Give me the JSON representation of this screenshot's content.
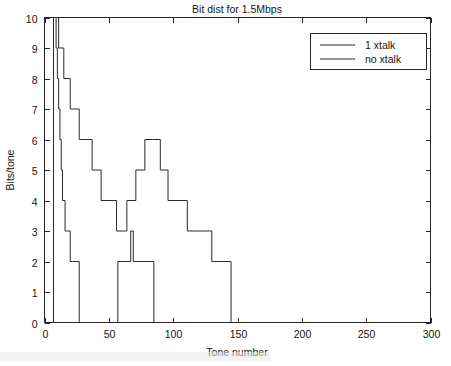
{
  "chart_data": {
    "type": "line",
    "title": "Bit dist for 1.5Mbps",
    "xlabel": "Tone number",
    "ylabel": "Bits/tone",
    "xlim": [
      0,
      300
    ],
    "ylim": [
      0,
      10
    ],
    "xticks": [
      0,
      50,
      100,
      150,
      200,
      250,
      300
    ],
    "yticks": [
      0,
      1,
      2,
      3,
      4,
      5,
      6,
      7,
      8,
      9,
      10
    ],
    "grid": false,
    "legend_position": "upper right",
    "series": [
      {
        "name": "1 xtalk",
        "comment": "broad staircase: rises at tone 7, plateaus, dips near tone 65, second peak of 6 near tone 90, decays to 0 at tone 145",
        "x": [
          6,
          7,
          7,
          11,
          11,
          15,
          15,
          20,
          20,
          27,
          27,
          37,
          37,
          44,
          44,
          56,
          56,
          62,
          62,
          64,
          64,
          71,
          71,
          78,
          78,
          84,
          84,
          90,
          90,
          96,
          96,
          103,
          103,
          111,
          111,
          122,
          122,
          130,
          130,
          145,
          145
        ],
        "y": [
          0,
          0,
          10,
          10,
          9,
          9,
          8,
          8,
          7,
          7,
          6,
          6,
          5,
          5,
          4,
          4,
          3,
          3,
          3,
          3,
          4,
          4,
          5,
          5,
          6,
          6,
          6,
          6,
          5,
          5,
          4,
          4,
          4,
          4,
          3,
          3,
          3,
          3,
          2,
          2,
          0
        ]
      },
      {
        "name": "no xtalk",
        "comment": "narrow steep staircase near origin plus a level-2 plateau between tones 57 and 85",
        "x": [
          6,
          7,
          7,
          9,
          9,
          10,
          10,
          11,
          11,
          12,
          12,
          13,
          13,
          14,
          14,
          16,
          16,
          18,
          18,
          20,
          20,
          22,
          22,
          27,
          27,
          57,
          57,
          67,
          67,
          69,
          69,
          85,
          85
        ],
        "y": [
          0,
          0,
          10,
          10,
          9,
          9,
          8,
          8,
          7,
          7,
          6,
          6,
          5,
          5,
          4,
          4,
          3,
          3,
          3,
          3,
          2,
          2,
          2,
          2,
          0,
          0,
          2,
          2,
          3,
          3,
          2,
          2,
          0
        ]
      }
    ]
  },
  "legend": {
    "entries": [
      {
        "label": "1 xtalk"
      },
      {
        "label": "no xtalk"
      }
    ]
  },
  "axes": {
    "x_tick_labels": [
      "0",
      "50",
      "100",
      "150",
      "200",
      "250",
      "300"
    ],
    "y_tick_labels": [
      "0",
      "1",
      "2",
      "3",
      "4",
      "5",
      "6",
      "7",
      "8",
      "9",
      "10"
    ]
  }
}
